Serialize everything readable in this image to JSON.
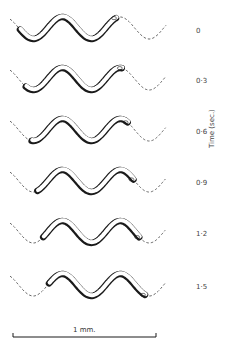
{
  "figure": {
    "axis_title": "Time (sec.)",
    "frames": [
      {
        "time_label": "0",
        "head_phase": 0.0
      },
      {
        "time_label": "0·3",
        "head_phase": 0.1
      },
      {
        "time_label": "0·6",
        "head_phase": 0.2
      },
      {
        "time_label": "0·9",
        "head_phase": 0.3
      },
      {
        "time_label": "1·2",
        "head_phase": 0.4
      },
      {
        "time_label": "1·5",
        "head_phase": 0.5
      }
    ],
    "scale_bar": {
      "label": "1 mm."
    },
    "colors": {
      "ink": "#1a1a1a",
      "body_fill": "#ffffff",
      "track": "#444444"
    }
  }
}
